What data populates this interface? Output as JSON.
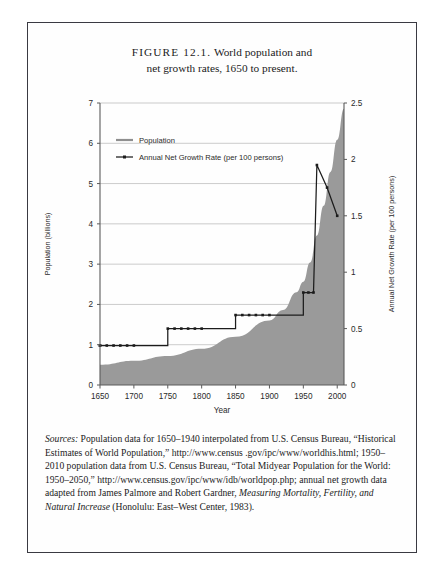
{
  "figure": {
    "label": "FIGURE 12.1.",
    "title_line1": "World population and",
    "title_line2": "net growth rates, 1650 to present."
  },
  "sources": {
    "lead": "Sources:",
    "text_1": " Population data for 1650–1940 interpolated from U.S. Census Bureau, “Historical Estimates of World Population,” http://www.census .gov/ipc/www/worldhis.html; 1950–2010 population data from U.S. Census Bureau, “Total Midyear Population for the World: 1950–2050,” http://www.census.gov/ipc/www/idb/worldpop.php; annual net growth data adapted from James Palmore and Robert Gardner, ",
    "italic_title": "Measuring Mortality, Fertility, and Natural Increase",
    "text_2": " (Honolulu: East–West Center, 1983)."
  },
  "chart_data": {
    "type": "area",
    "title": "",
    "xlabel": "Year",
    "ylabel": "Population (billions)",
    "y2label": "Annual Net Growth Rate (per 100 persons)",
    "xlim": [
      1650,
      2010
    ],
    "ylim": [
      0,
      7
    ],
    "y2lim": [
      0,
      2.5
    ],
    "xticks": [
      1650,
      1700,
      1750,
      1800,
      1850,
      1900,
      1950,
      2000
    ],
    "yticks": [
      0,
      1,
      2,
      3,
      4,
      5,
      6,
      7
    ],
    "y2ticks": [
      0,
      0.5,
      1,
      1.5,
      2,
      2.5
    ],
    "grid": true,
    "legend_position": "upper-left",
    "colors": {
      "area_fill": "#9a9a9a",
      "line": "#1c1c1c",
      "grid": "#b5b5b5",
      "axis": "#5a5a5a"
    },
    "series": [
      {
        "name": "Population",
        "type": "area",
        "unit": "billions",
        "axis": "left",
        "x": [
          1650,
          1700,
          1750,
          1800,
          1850,
          1900,
          1920,
          1940,
          1950,
          1960,
          1970,
          1980,
          1990,
          2000,
          2010
        ],
        "values": [
          0.5,
          0.6,
          0.72,
          0.9,
          1.2,
          1.6,
          1.86,
          2.3,
          2.56,
          3.04,
          3.71,
          4.45,
          5.29,
          6.09,
          6.86
        ]
      },
      {
        "name": "Annual Net Growth Rate (per 100 persons)",
        "type": "step-line",
        "unit": "per 100 persons",
        "axis": "right",
        "x": [
          1650,
          1700,
          1750,
          1800,
          1850,
          1900,
          1950,
          1965,
          1970,
          1985,
          2000
        ],
        "values": [
          0.35,
          0.35,
          0.5,
          0.5,
          0.62,
          0.62,
          0.82,
          0.82,
          1.95,
          1.75,
          1.5
        ],
        "marker": "square",
        "note": "step function: constant 0.35 (1650-1750), 0.5 (1750-1850), 0.62 (1850-1900), 0.82 (1900-1950), then rises sharply to peak 1.95 near 1965-1970 and declines to ~1.5 by 2000"
      }
    ]
  }
}
